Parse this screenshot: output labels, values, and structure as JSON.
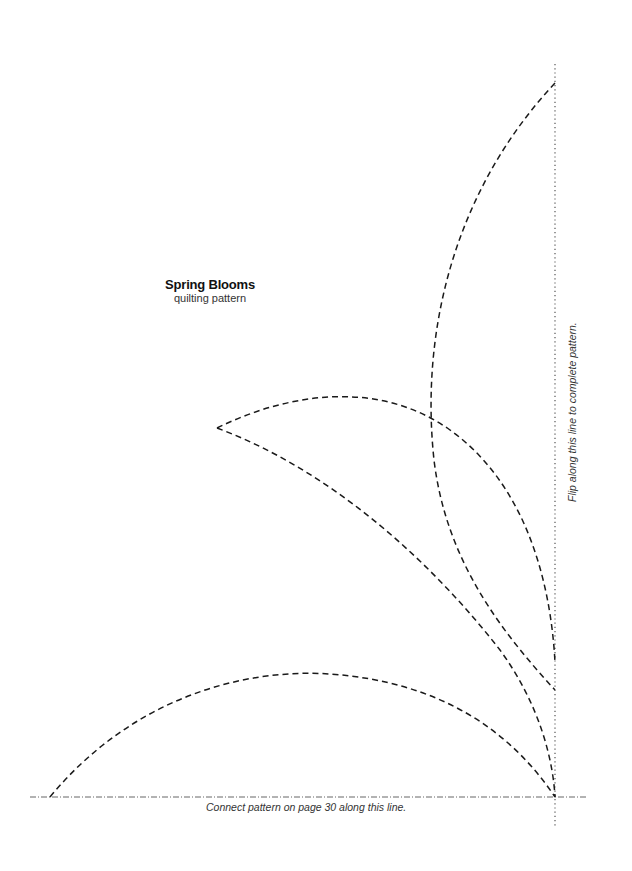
{
  "document": {
    "title": "Spring Blooms",
    "subtitle": "quilting pattern",
    "bottom_instruction": "Connect pattern on page 30 along this line.",
    "side_instruction": "Flip along this line to complete pattern."
  },
  "lines": {
    "stroke_color": "#1a1a1a",
    "guide_color": "#555555",
    "pattern_style": "dashed",
    "fold_line_style": "dotted",
    "connect_line_style": "dash-dot"
  }
}
